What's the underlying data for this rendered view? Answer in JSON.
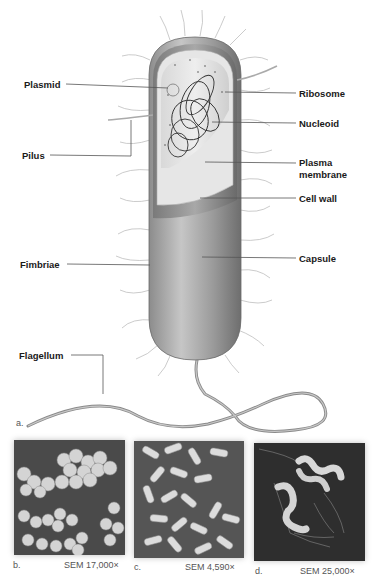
{
  "figure": {
    "panel_a_letter": "a.",
    "labels_left": {
      "plasmid": "Plasmid",
      "pilus": "Pilus",
      "fimbriae": "Fimbriae",
      "flagellum": "Flagellum"
    },
    "labels_right": {
      "ribosome": "Ribosome",
      "nucleoid": "Nucleoid",
      "plasma_line1": "Plasma",
      "plasma_line2": "membrane",
      "cell_wall": "Cell wall",
      "capsule": "Capsule"
    },
    "micrographs": [
      {
        "letter": "b.",
        "caption": "SEM 17,000×",
        "subject": "cocci cluster"
      },
      {
        "letter": "c.",
        "caption": "SEM 4,590×",
        "subject": "bacilli cluster"
      },
      {
        "letter": "d.",
        "caption": "SEM 25,000×",
        "subject": "spirilla with flagella"
      }
    ]
  }
}
